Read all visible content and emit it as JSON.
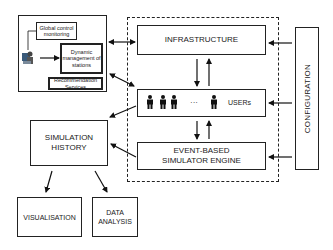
{
  "control_panel": {
    "global_control": "Global control monitoring",
    "dynamic_management": "Dynamic management of stations",
    "recommendation": "Recommendation Services",
    "operator_icon": "operator-computer-icon"
  },
  "simulator": {
    "infrastructure": "INFRASTRUCTURE",
    "users": "USERs",
    "ellipsis": "···",
    "engine": "EVENT-BASED SIMULATOR ENGINE",
    "user_icon": "person-icon"
  },
  "configuration": "CONFIGURATION",
  "simulation_history": "SIMULATION HISTORY",
  "outputs": {
    "visualisation": "VISUALISATION",
    "data_analysis": "DATA ANALYSIS"
  }
}
